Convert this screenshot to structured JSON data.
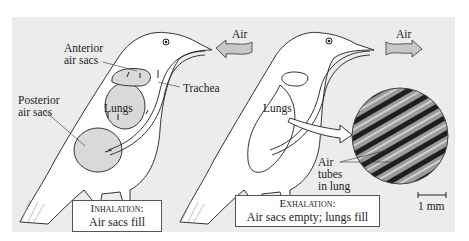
{
  "figure": {
    "left_bird": {
      "labels": {
        "anterior": "Anterior\nair sacs",
        "anterior_line1": "Anterior",
        "anterior_line2": "air sacs",
        "posterior_line1": "Posterior",
        "posterior_line2": "air sacs",
        "trachea": "Trachea",
        "lungs": "Lungs",
        "air": "Air"
      },
      "caption": {
        "title": "Inhalation:",
        "text": "Air sacs fill"
      }
    },
    "right_bird": {
      "labels": {
        "lungs": "Lungs",
        "air": "Air",
        "tubes_line1": "Air",
        "tubes_line2": "tubes",
        "tubes_line3": "in lung",
        "scale": "1 mm"
      },
      "caption": {
        "title": "Exhalation:",
        "text": "Air sacs empty; lungs fill"
      }
    },
    "colors": {
      "panel": "#ececec",
      "sac_fill": "#d9d9d9",
      "arrow_fill": "#c8c8c8",
      "micrograph": "#555555"
    }
  }
}
